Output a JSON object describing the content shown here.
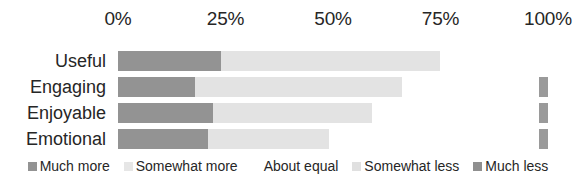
{
  "chart_data": {
    "type": "bar",
    "subtype": "stacked-horizontal-100",
    "title": "",
    "xlabel": "",
    "ylabel": "",
    "xlim": [
      0,
      100
    ],
    "grid": false,
    "legend_position": "bottom",
    "categories": [
      "Useful",
      "Engaging",
      "Enjoyable",
      "Emotional"
    ],
    "axis_ticks": [
      "0%",
      "25%",
      "50%",
      "75%",
      "100%"
    ],
    "axis_tick_values": [
      0,
      25,
      50,
      75,
      100
    ],
    "series": [
      {
        "name": "Much more",
        "color": "#939393",
        "values": [
          24,
          18,
          22,
          21
        ]
      },
      {
        "name": "Somewhat more",
        "color": "#e3e3e3",
        "values": [
          51,
          48,
          37,
          28
        ]
      },
      {
        "name": "About equal",
        "color": "#ffffff",
        "values": [
          25,
          32,
          39,
          49
        ]
      },
      {
        "name": "Somewhat less",
        "color": "#efefef",
        "values": [
          0,
          0,
          0,
          0
        ]
      },
      {
        "name": "Much less",
        "color": "#9a9a9a",
        "values": [
          0,
          2,
          2,
          2
        ]
      }
    ]
  },
  "legend": {
    "items": [
      {
        "label": "Much more",
        "color": "#939393"
      },
      {
        "label": "Somewhat more",
        "color": "#e6e6e6"
      },
      {
        "label": "About equal",
        "color": "#ffffff"
      },
      {
        "label": "Somewhat less",
        "color": "#e0e0e0"
      },
      {
        "label": "Much less",
        "color": "#8f8f8f"
      }
    ]
  }
}
